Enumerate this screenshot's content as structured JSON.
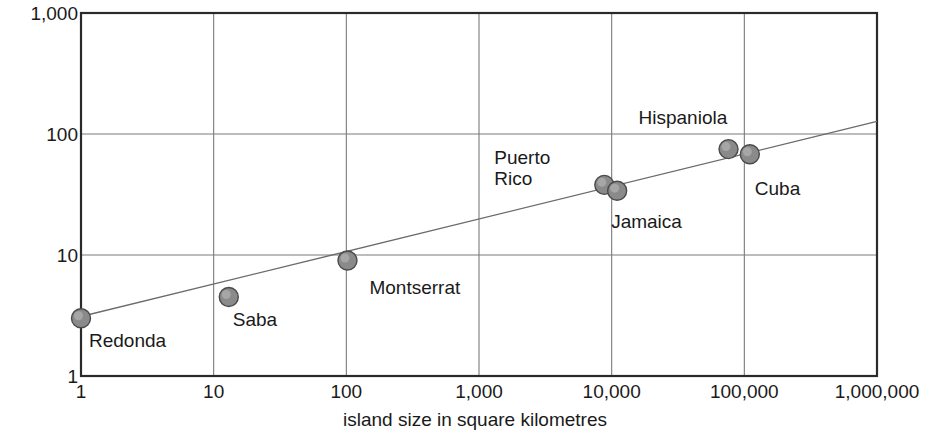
{
  "chart_data": {
    "type": "scatter",
    "title": "",
    "xlabel": "island size in square kilometres",
    "ylabel": "number of species",
    "xscale": "log",
    "yscale": "log",
    "xlim": [
      1,
      1000000
    ],
    "ylim": [
      1,
      1000
    ],
    "grid": true,
    "legend": "none",
    "xticklabels": [
      "1",
      "10",
      "100",
      "1,000",
      "10,000",
      "100,000",
      "1,000,000"
    ],
    "xtickvalues": [
      1,
      10,
      100,
      1000,
      10000,
      100000,
      1000000
    ],
    "yticklabels": [
      "1",
      "10",
      "100",
      "1,000"
    ],
    "ytickvalues": [
      1,
      10,
      100,
      1000
    ],
    "marker_color": "#8a8a8a",
    "marker_edge_color": "#4a4a4a",
    "line_color": "#6b6b6b",
    "axis_color": "#2a2a2a",
    "grid_color": "#7a7a7a",
    "points": [
      {
        "label": "Redonda",
        "x": 1,
        "y": 3,
        "label_dx": 8,
        "label_dy": 12
      },
      {
        "label": "Saba",
        "x": 13,
        "y": 4.5,
        "label_dx": 4,
        "label_dy": 12
      },
      {
        "label": "Montserrat",
        "x": 102,
        "y": 9,
        "label_dx": 22,
        "label_dy": 16
      },
      {
        "label": "Puerto\nRico",
        "x": 8800,
        "y": 38,
        "label_dx": -110,
        "label_dy": -38
      },
      {
        "label": "Jamaica",
        "x": 11000,
        "y": 34,
        "label_dx": -6,
        "label_dy": 20
      },
      {
        "label": "Hispaniola",
        "x": 76000,
        "y": 75,
        "label_dx": -90,
        "label_dy": -42
      },
      {
        "label": "Cuba",
        "x": 110000,
        "y": 68,
        "label_dx": 5,
        "label_dy": 24
      }
    ],
    "trendline": {
      "x_start": 1,
      "y_start": 3.1,
      "x_end": 1000000,
      "y_end": 127
    }
  }
}
